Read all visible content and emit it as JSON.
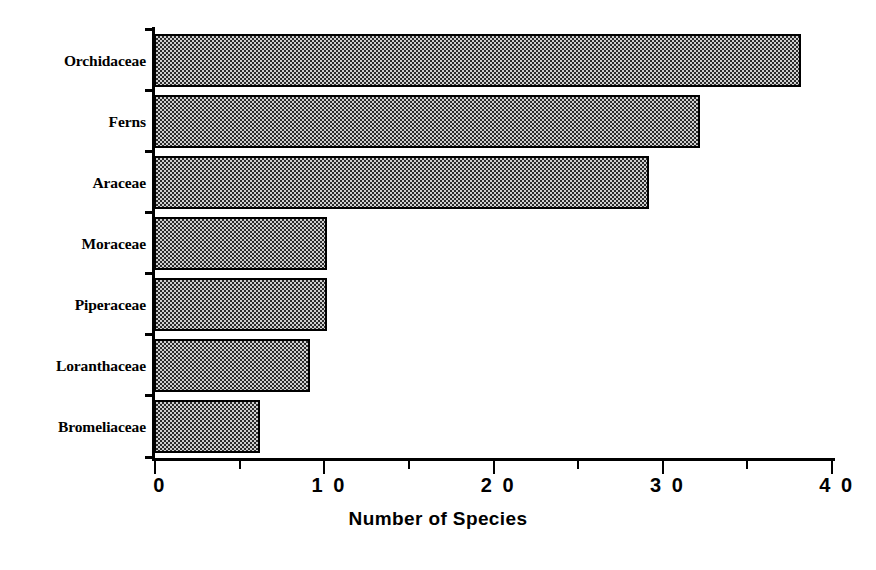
{
  "chart_data": {
    "type": "bar",
    "orientation": "horizontal",
    "title": "",
    "subtitle": "",
    "xlabel": "Number of Species",
    "ylabel": "",
    "categories": [
      "Orchidaceae",
      "Ferns",
      "Araceae",
      "Moraceae",
      "Piperaceae",
      "Loranthaceae",
      "Bromeliaceae"
    ],
    "values": [
      38,
      32,
      29,
      10,
      10,
      9,
      6
    ],
    "xlim": [
      0,
      40
    ],
    "x_major_ticks": [
      0,
      10,
      20,
      30,
      40
    ],
    "x_major_tick_labels": [
      "0",
      "1 0",
      "2 0",
      "3 0",
      "4 0"
    ],
    "x_minor_ticks": [
      5,
      15,
      25,
      35
    ],
    "grid": false,
    "legend": null,
    "bar_fill": "#9a9a9a",
    "bar_fill_pattern": "checkerboard-dither",
    "bar_border_color": "#000000",
    "axis_color": "#000000",
    "background": "#ffffff"
  },
  "axis": {
    "x_title": "Number of Species"
  }
}
